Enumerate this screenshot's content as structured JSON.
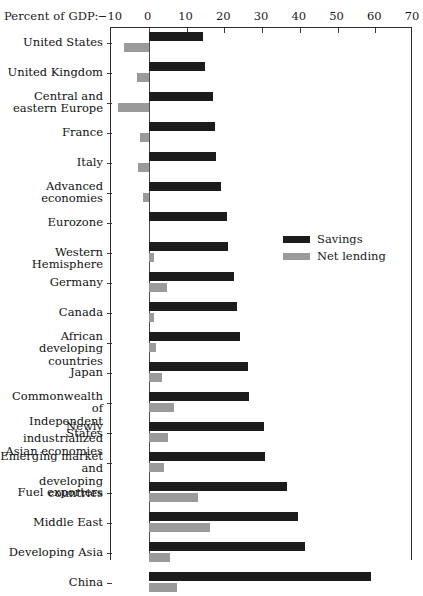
{
  "chart_data": {
    "type": "bar",
    "orientation": "horizontal",
    "title": "",
    "xlabel": "Percent of GDP:",
    "ylabel": "",
    "xlim": [
      -10,
      70
    ],
    "xticks": [
      -10,
      0,
      10,
      20,
      30,
      40,
      50,
      60,
      70
    ],
    "xtick_labels": [
      "−10",
      "0",
      "10",
      "20",
      "30",
      "40",
      "50",
      "60",
      "70"
    ],
    "grid": false,
    "legend_position": "upper-right-inside",
    "categories": [
      "United States",
      "United Kingdom",
      "Central and\neastern Europe",
      "France",
      "Italy",
      "Advanced\neconomies",
      "Eurozone",
      "Western Hemisphere",
      "Germany",
      "Canada",
      "African\ndeveloping countries",
      "Japan",
      "Commonwealth of\nIndependent States",
      "Newly industrialized\nAsian economies",
      "Emerging market and\ndeveloping countries",
      "Fuel exporters",
      "Middle East",
      "Developing Asia",
      "China"
    ],
    "series": [
      {
        "name": "Savings",
        "color": "#1c1c1c",
        "values": [
          14.3,
          14.8,
          17.0,
          17.6,
          17.8,
          19.1,
          20.6,
          21.0,
          22.5,
          23.4,
          24.2,
          26.3,
          26.6,
          30.4,
          30.7,
          36.7,
          39.6,
          41.4,
          59.0
        ]
      },
      {
        "name": "Net lending",
        "color": "#9a9a9a",
        "values": [
          -6.5,
          -3.1,
          -8.2,
          -2.4,
          -2.8,
          -1.5,
          0.0,
          1.3,
          4.8,
          1.5,
          1.9,
          3.6,
          6.8,
          5.2,
          4.0,
          13.0,
          16.1,
          5.6,
          7.4
        ]
      }
    ]
  },
  "legend": {
    "items": [
      {
        "label": "Savings",
        "color": "#1c1c1c"
      },
      {
        "label": "Net lending",
        "color": "#9a9a9a"
      }
    ]
  }
}
